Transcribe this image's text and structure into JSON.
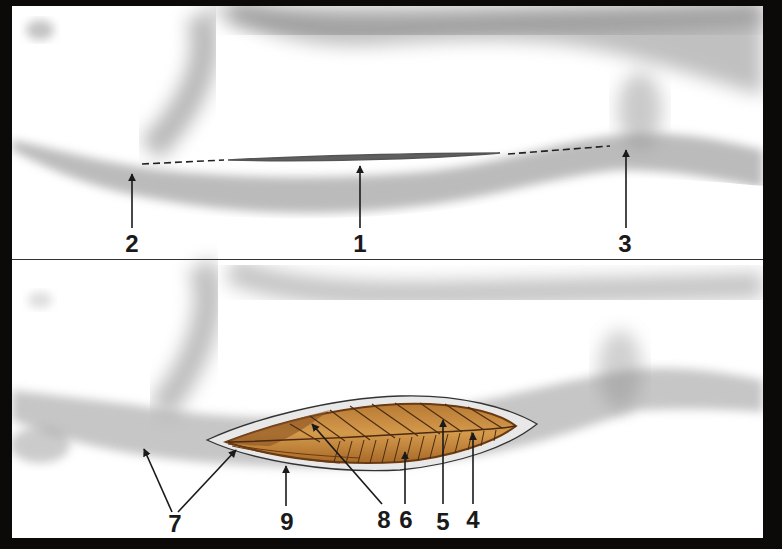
{
  "figure": {
    "top_panel": {
      "name": "incision-plan",
      "labels": [
        {
          "id": "2",
          "text": "2",
          "x": 132,
          "y": 232
        },
        {
          "id": "1",
          "text": "1",
          "x": 360,
          "y": 232
        },
        {
          "id": "3",
          "text": "3",
          "x": 625,
          "y": 232
        }
      ]
    },
    "bottom_panel": {
      "name": "exposed-muscle",
      "labels": [
        {
          "id": "7",
          "text": "7",
          "x": 175,
          "y": 512
        },
        {
          "id": "9",
          "text": "9",
          "x": 287,
          "y": 510
        },
        {
          "id": "8",
          "text": "8",
          "x": 384,
          "y": 508
        },
        {
          "id": "6",
          "text": "6",
          "x": 406,
          "y": 508
        },
        {
          "id": "5",
          "text": "5",
          "x": 443,
          "y": 510
        },
        {
          "id": "4",
          "text": "4",
          "x": 473,
          "y": 508
        }
      ]
    },
    "colors": {
      "frame": "#0b0a09",
      "background": "#ffffff",
      "skin_shade": "#9a9a9a",
      "muscle": "#c68a3c",
      "muscle_dark": "#7a4a1c",
      "fiber_line": "#4a2a10",
      "label": "#1a1a1a"
    }
  }
}
